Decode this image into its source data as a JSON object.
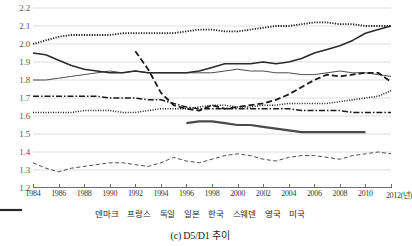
{
  "caption": "(c) D5/D1 추이",
  "chart_data": {
    "type": "line",
    "title": "(c) D5/D1 추이",
    "xlabel": "(년)",
    "ylabel": "",
    "ylim": [
      1.2,
      2.2
    ],
    "xlim": [
      1984,
      2012
    ],
    "grid": true,
    "legend_position": "bottom",
    "yticks": [
      "1.2",
      "1.3",
      "1.4",
      "1.5",
      "1.6",
      "1.7",
      "1.8",
      "1.9",
      "2.0",
      "2.1",
      "2.2"
    ],
    "ytick_values": [
      1.2,
      1.3,
      1.4,
      1.5,
      1.6,
      1.7,
      1.8,
      1.9,
      2.0,
      2.1,
      2.2
    ],
    "xticks": [
      "1984",
      "1986",
      "1988",
      "1990",
      "1992",
      "1994",
      "1996",
      "1998",
      "2000",
      "2002",
      "2004",
      "2006",
      "2008",
      "2010",
      "2012(년)"
    ],
    "xtick_values": [
      1984,
      1986,
      1988,
      1990,
      1992,
      1994,
      1996,
      1998,
      2000,
      2002,
      2004,
      2006,
      2008,
      2010,
      2012
    ],
    "x": [
      1984,
      1985,
      1986,
      1987,
      1988,
      1989,
      1990,
      1991,
      1992,
      1993,
      1994,
      1995,
      1996,
      1997,
      1998,
      1999,
      2000,
      2001,
      2002,
      2003,
      2004,
      2005,
      2006,
      2007,
      2008,
      2009,
      2010,
      2011,
      2012
    ],
    "series": [
      {
        "name": "덴마크",
        "name_en": "Denmark",
        "style": "dotted",
        "width": 1.8,
        "color": "#1a1a1a",
        "x": [
          1984,
          1985,
          1986,
          1987,
          1988,
          1989,
          1990,
          1991,
          1992,
          1993,
          1994,
          1995,
          1996,
          1997,
          1998,
          1999,
          2000,
          2001,
          2002,
          2003,
          2004,
          2005,
          2006,
          2007,
          2008,
          2009,
          2010,
          2011,
          2012
        ],
        "values": [
          2.0,
          2.02,
          2.04,
          2.05,
          2.05,
          2.05,
          2.05,
          2.06,
          2.06,
          2.06,
          2.06,
          2.06,
          2.07,
          2.08,
          2.08,
          2.07,
          2.07,
          2.08,
          2.09,
          2.1,
          2.1,
          2.11,
          2.12,
          2.12,
          2.11,
          2.11,
          2.1,
          2.1,
          2.1
        ]
      },
      {
        "name": "프랑스",
        "name_en": "France",
        "style": "solid-thin",
        "width": 1.0,
        "color": "#4d4d4d",
        "x": [
          1984,
          1985,
          1986,
          1987,
          1988,
          1989,
          1990,
          1991,
          1992,
          1993,
          1994,
          1995,
          1996,
          1997,
          1998,
          1999,
          2000,
          2001,
          2002,
          2003,
          2004,
          2005,
          2006,
          2007,
          2008,
          2009,
          2010,
          2011,
          2012
        ],
        "values": [
          1.8,
          1.8,
          1.81,
          1.82,
          1.83,
          1.84,
          1.85,
          1.84,
          1.85,
          1.84,
          1.84,
          1.84,
          1.84,
          1.84,
          1.84,
          1.85,
          1.86,
          1.85,
          1.85,
          1.84,
          1.84,
          1.83,
          1.83,
          1.84,
          1.85,
          1.84,
          1.84,
          1.83,
          1.82
        ]
      },
      {
        "name": "독일",
        "name_en": "Germany",
        "style": "dashed",
        "width": 1.8,
        "color": "#1a1a1a",
        "x": [
          1992,
          1993,
          1994,
          1995,
          1996,
          1997,
          1998,
          1999,
          2000,
          2001,
          2002,
          2003,
          2004,
          2005,
          2006,
          2007,
          2008,
          2009,
          2010,
          2011,
          2012
        ],
        "values": [
          1.96,
          1.86,
          1.73,
          1.66,
          1.64,
          1.63,
          1.66,
          1.64,
          1.65,
          1.66,
          1.67,
          1.69,
          1.72,
          1.76,
          1.8,
          1.83,
          1.82,
          1.83,
          1.84,
          1.84,
          1.79
        ]
      },
      {
        "name": "일본",
        "name_en": "Japan",
        "style": "dashdot",
        "width": 1.5,
        "color": "#1a1a1a",
        "x": [
          1984,
          1985,
          1986,
          1987,
          1988,
          1989,
          1990,
          1991,
          1992,
          1993,
          1994,
          1995,
          1996,
          1997,
          1998,
          1999,
          2000,
          2001,
          2002,
          2003,
          2004,
          2005,
          2006,
          2007,
          2008,
          2009,
          2010,
          2011,
          2012
        ],
        "values": [
          1.71,
          1.71,
          1.71,
          1.71,
          1.71,
          1.71,
          1.7,
          1.7,
          1.7,
          1.69,
          1.69,
          1.67,
          1.65,
          1.64,
          1.64,
          1.64,
          1.64,
          1.64,
          1.64,
          1.64,
          1.64,
          1.63,
          1.63,
          1.63,
          1.63,
          1.62,
          1.62,
          1.62,
          1.62
        ]
      },
      {
        "name": "한국",
        "name_en": "Korea",
        "style": "solid-thick",
        "width": 2.2,
        "color": "#4a4a4a",
        "x": [
          1996,
          1997,
          1998,
          1999,
          2000,
          2001,
          2002,
          2003,
          2004,
          2005,
          2006,
          2007,
          2008,
          2009,
          2010
        ],
        "values": [
          1.56,
          1.57,
          1.57,
          1.56,
          1.55,
          1.55,
          1.54,
          1.53,
          1.52,
          1.51,
          1.51,
          1.51,
          1.51,
          1.51,
          1.51
        ]
      },
      {
        "name": "스웨덴",
        "name_en": "Sweden",
        "style": "dashed-thin",
        "width": 1.0,
        "color": "#4d4d4d",
        "x": [
          1984,
          1985,
          1986,
          1987,
          1988,
          1989,
          1990,
          1991,
          1992,
          1993,
          1994,
          1995,
          1996,
          1997,
          1998,
          1999,
          2000,
          2001,
          2002,
          2003,
          2004,
          2005,
          2006,
          2007,
          2008,
          2009,
          2010,
          2011,
          2012
        ],
        "values": [
          1.34,
          1.31,
          1.29,
          1.31,
          1.32,
          1.33,
          1.34,
          1.34,
          1.33,
          1.32,
          1.34,
          1.37,
          1.35,
          1.34,
          1.36,
          1.38,
          1.39,
          1.38,
          1.36,
          1.35,
          1.37,
          1.38,
          1.38,
          1.37,
          1.36,
          1.38,
          1.39,
          1.4,
          1.39
        ]
      },
      {
        "name": "영국",
        "name_en": "United Kingdom",
        "style": "solid-med",
        "width": 1.6,
        "color": "#2b2b2b",
        "x": [
          1984,
          1985,
          1986,
          1987,
          1988,
          1989,
          1990,
          1991,
          1992,
          1993,
          1994,
          1995,
          1996,
          1997,
          1998,
          1999,
          2000,
          2001,
          2002,
          2003,
          2004,
          2005,
          2006,
          2007,
          2008,
          2009,
          2010,
          2011,
          2012
        ],
        "values": [
          1.95,
          1.94,
          1.91,
          1.88,
          1.86,
          1.85,
          1.84,
          1.84,
          1.85,
          1.84,
          1.84,
          1.84,
          1.84,
          1.85,
          1.87,
          1.89,
          1.89,
          1.89,
          1.9,
          1.89,
          1.9,
          1.92,
          1.95,
          1.97,
          1.99,
          2.02,
          2.06,
          2.08,
          2.1
        ]
      },
      {
        "name": "미국",
        "name_en": "United States",
        "style": "dotted-fine",
        "width": 1.5,
        "color": "#1a1a1a",
        "x": [
          1984,
          1985,
          1986,
          1987,
          1988,
          1989,
          1990,
          1991,
          1992,
          1993,
          1994,
          1995,
          1996,
          1997,
          1998,
          1999,
          2000,
          2001,
          2002,
          2003,
          2004,
          2005,
          2006,
          2007,
          2008,
          2009,
          2010,
          2011,
          2012
        ],
        "values": [
          1.62,
          1.62,
          1.62,
          1.62,
          1.63,
          1.63,
          1.63,
          1.62,
          1.62,
          1.63,
          1.64,
          1.64,
          1.64,
          1.65,
          1.66,
          1.66,
          1.65,
          1.65,
          1.66,
          1.66,
          1.67,
          1.67,
          1.67,
          1.67,
          1.68,
          1.69,
          1.7,
          1.71,
          1.74
        ]
      }
    ]
  },
  "legend": {
    "items": [
      {
        "label": "덴마크",
        "style": "dotted"
      },
      {
        "label": "프랑스",
        "style": "solid-thin"
      },
      {
        "label": "독일",
        "style": "dashed"
      },
      {
        "label": "일본",
        "style": "dashdot"
      },
      {
        "label": "한국",
        "style": "solid-thick"
      },
      {
        "label": "스웨덴",
        "style": "dashed-thin"
      },
      {
        "label": "영국",
        "style": "solid-med"
      },
      {
        "label": "미국",
        "style": "dotted-fine"
      }
    ]
  }
}
